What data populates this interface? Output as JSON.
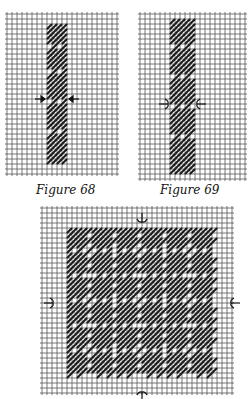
{
  "figures": [
    {
      "id": "figure-68",
      "caption": "Figure 68",
      "grid": {
        "x": 7,
        "y": 14,
        "cols": 22,
        "rows": 32,
        "cell": 5
      },
      "stitch_band": {
        "col_start": 8,
        "col_end": 12,
        "row_start": 2,
        "row_end": 30
      },
      "blocks_gap_rows": [
        6,
        11,
        17,
        23
      ],
      "center_row": 17,
      "arrow_style": "straight"
    },
    {
      "id": "figure-69",
      "caption": "Figure 69",
      "grid": {
        "x": 140,
        "y": 14,
        "cols": 21,
        "rows": 33,
        "cell": 5
      },
      "stitch_band": {
        "col_start": 6,
        "col_end": 11,
        "row_start": 1,
        "row_end": 32
      },
      "blocks_gap_rows": [
        6,
        12,
        18,
        24
      ],
      "center_row": 18,
      "arrow_style": "bracket"
    },
    {
      "id": "figure-70",
      "caption": "",
      "grid": {
        "x": 42,
        "y": 208,
        "cols": 38,
        "rows": 37,
        "cell": 5
      },
      "stitch_area": {
        "col_start": 5,
        "col_end": 35,
        "row_start": 4,
        "row_end": 34
      },
      "block_size": 5,
      "center_col": 20,
      "center_row": 19,
      "arrow_style": "bracket"
    }
  ],
  "colors": {
    "grid": "#555555",
    "stitch": "#1a1a1a",
    "background": "#ffffff"
  }
}
